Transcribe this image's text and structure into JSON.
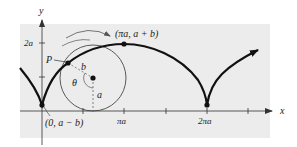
{
  "figure": {
    "type": "prolate-cycloid-diagram",
    "axes": {
      "x_label": "x",
      "y_label": "y",
      "y_ticks": [
        {
          "label": "2a",
          "value": "2a"
        },
        {
          "label": "",
          "value": "a"
        }
      ],
      "x_ticks": [
        {
          "label": "",
          "value": "πa/2"
        },
        {
          "label": "πa",
          "value": "πa"
        },
        {
          "label": "",
          "value": "3πa/2"
        },
        {
          "label": "2πa",
          "value": "2πa"
        },
        {
          "label": "",
          "value": "5πa/2"
        }
      ]
    },
    "points": {
      "start": "(0, a − b)",
      "top": "(πa, a + b)",
      "p": "P"
    },
    "circle_labels": {
      "radius_b": "b",
      "radius_a": "a",
      "angle": "θ"
    },
    "colors": {
      "panel": "#ececec",
      "curve": "#111111",
      "axis": "#333333",
      "circle": "#333333"
    }
  }
}
